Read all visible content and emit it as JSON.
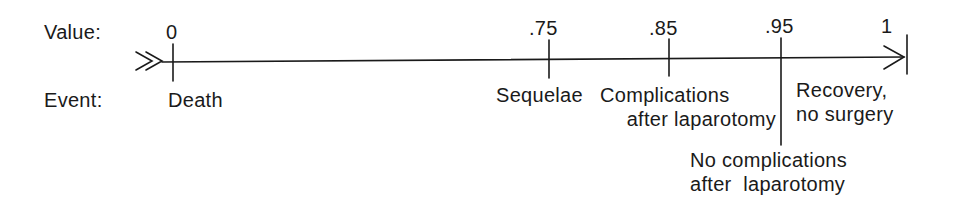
{
  "row_labels": {
    "value": "Value:",
    "event": "Event:"
  },
  "ticks": [
    {
      "value": "0",
      "event_lines": [
        "Death"
      ]
    },
    {
      "value": ".75",
      "event_lines": [
        "Sequelae"
      ]
    },
    {
      "value": ".85",
      "event_lines": [
        "Complications",
        "after laparotomy"
      ]
    },
    {
      "value": ".95",
      "event_lines": [
        "No complications",
        "after  laparotomy"
      ]
    },
    {
      "value": "1",
      "event_lines": [
        "Recovery,",
        "no surgery"
      ]
    }
  ],
  "colors": {
    "ink": "#1a1a1a",
    "background": "#ffffff"
  }
}
